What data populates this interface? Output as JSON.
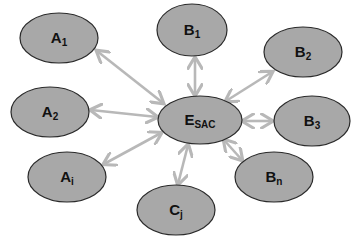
{
  "diagram": {
    "type": "hub-and-spoke",
    "colors": {
      "node_fill": "#a8a8a8",
      "node_stroke": "#2a2a2a",
      "edge": "#b8b8b8",
      "background": "#ffffff"
    },
    "hub": {
      "id": "E_SAC",
      "base": "E",
      "sub": "SAC",
      "cx": 200,
      "cy": 120,
      "rx": 42,
      "ry": 24
    },
    "nodes": [
      {
        "id": "A1",
        "base": "A",
        "sub": "1",
        "cx": 59,
        "cy": 38,
        "rx": 39,
        "ry": 25
      },
      {
        "id": "A2",
        "base": "A",
        "sub": "2",
        "cx": 50,
        "cy": 112,
        "rx": 39,
        "ry": 25
      },
      {
        "id": "Ai",
        "base": "A",
        "sub": "i",
        "cx": 67,
        "cy": 177,
        "rx": 39,
        "ry": 25
      },
      {
        "id": "B1",
        "base": "B",
        "sub": "1",
        "cx": 192,
        "cy": 30,
        "rx": 35,
        "ry": 26
      },
      {
        "id": "B2",
        "base": "B",
        "sub": "2",
        "cx": 303,
        "cy": 52,
        "rx": 39,
        "ry": 25
      },
      {
        "id": "B3",
        "base": "B",
        "sub": "3",
        "cx": 312,
        "cy": 121,
        "rx": 38,
        "ry": 25
      },
      {
        "id": "Bn",
        "base": "B",
        "sub": "n",
        "cx": 274,
        "cy": 177,
        "rx": 39,
        "ry": 25
      },
      {
        "id": "Cj",
        "base": "C",
        "sub": "j",
        "cx": 176,
        "cy": 210,
        "rx": 39,
        "ry": 25
      }
    ],
    "edges": [
      {
        "from": "E_SAC",
        "to": "A1",
        "x1": 163,
        "y1": 103,
        "x2": 97,
        "y2": 51
      },
      {
        "from": "E_SAC",
        "to": "A2",
        "x1": 157,
        "y1": 117,
        "x2": 91,
        "y2": 110
      },
      {
        "from": "E_SAC",
        "to": "Ai",
        "x1": 161,
        "y1": 133,
        "x2": 104,
        "y2": 164
      },
      {
        "from": "E_SAC",
        "to": "B1",
        "x1": 195,
        "y1": 95,
        "x2": 195,
        "y2": 58
      },
      {
        "from": "E_SAC",
        "to": "B2",
        "x1": 226,
        "y1": 101,
        "x2": 272,
        "y2": 72
      },
      {
        "from": "E_SAC",
        "to": "B3",
        "x1": 243,
        "y1": 121,
        "x2": 272,
        "y2": 121
      },
      {
        "from": "E_SAC",
        "to": "Bn",
        "x1": 224,
        "y1": 140,
        "x2": 242,
        "y2": 160
      },
      {
        "from": "E_SAC",
        "to": "Cj",
        "x1": 188,
        "y1": 145,
        "x2": 178,
        "y2": 184
      }
    ],
    "edge_style": "double-headed arrow"
  }
}
